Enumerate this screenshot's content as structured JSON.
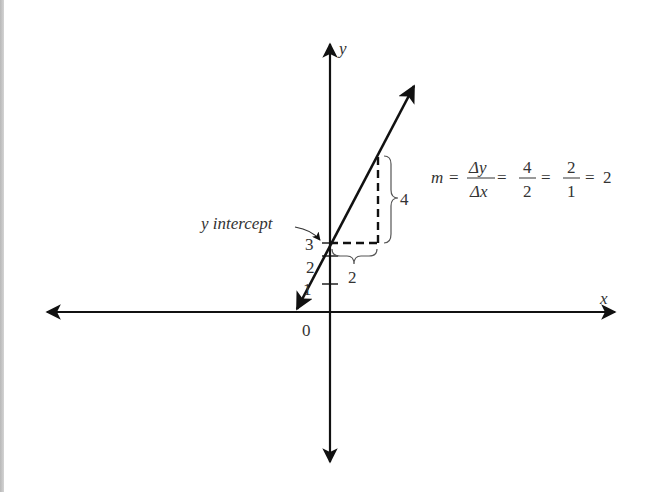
{
  "figure": {
    "axes": {
      "x_label": "x",
      "y_label": "y",
      "origin_label": "0",
      "y_ticks": [
        "1",
        "2",
        "3"
      ]
    },
    "annotations": {
      "intercept_label": "y intercept",
      "rise_label": "4",
      "run_label": "2"
    },
    "formula": {
      "lhs": "m",
      "eq": "=",
      "frac1_num": "Δy",
      "frac1_den": "Δx",
      "frac2_num": "4",
      "frac2_den": "2",
      "frac3_num": "2",
      "frac3_den": "1",
      "result": "2"
    },
    "line": {
      "slope": 2,
      "y_intercept": 3,
      "equation": "y = 2x + 3"
    },
    "colors": {
      "line": "#111111",
      "text": "#333333",
      "brace": "#555555"
    }
  }
}
